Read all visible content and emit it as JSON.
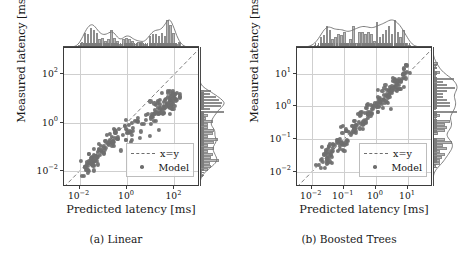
{
  "figure": {
    "width": 465,
    "height": 262,
    "background": "#ffffff",
    "point_color": "#6e6e6e",
    "hist_fill": "#b9b9b9",
    "hist_edge": "#8d8d8d",
    "axis_color": "#3b3b3b",
    "grid_color": "#cfcfcf"
  },
  "chart_data": [
    {
      "type": "scatter",
      "panel_id": "a",
      "caption": "(a) Linear",
      "title": "",
      "xlabel": "Predicted latency [ms]",
      "ylabel": "Measured latency [ms]",
      "xscale": "log",
      "yscale": "log",
      "xlim": [
        0.0022,
        1200
      ],
      "ylim": [
        0.0022,
        1200
      ],
      "grid": true,
      "legend_position": "lower right",
      "xticks": [
        0.01,
        1,
        100
      ],
      "xticklabels": [
        "10−2",
        "10⁰",
        "10²"
      ],
      "yticks": [
        0.01,
        1,
        100
      ],
      "yticklabels": [
        "10−2",
        "10⁰",
        "10²"
      ],
      "xtick_exponents": [
        "-2",
        "0",
        "2"
      ],
      "ytick_exponents": [
        "-2",
        "0",
        "2"
      ],
      "series": [
        {
          "name": "x=y",
          "type": "line",
          "style": "dashed",
          "color": "#6e6e6e",
          "points": [
            [
              0.0022,
              0.0022
            ],
            [
              1200,
              1200
            ]
          ]
        },
        {
          "name": "Model",
          "type": "scatter",
          "marker": "o",
          "color": "#6e6e6e",
          "n_points": 214,
          "x": [
            0.0041,
            0.0047,
            0.0052,
            0.0058,
            0.0061,
            0.0066,
            0.0072,
            0.0078,
            0.0085,
            0.0092,
            0.0098,
            0.0105,
            0.0112,
            0.0119,
            0.0128,
            0.0136,
            0.0145,
            0.0152,
            0.0163,
            0.0174,
            0.0186,
            0.0195,
            0.0208,
            0.0221,
            0.0235,
            0.0249,
            0.0262,
            0.0278,
            0.0295,
            0.0312,
            0.033,
            0.0349,
            0.0369,
            0.0391,
            0.0414,
            0.0438,
            0.0463,
            0.049,
            0.0519,
            0.0549,
            0.0581,
            0.0615,
            0.0651,
            0.0689,
            0.0729,
            0.0772,
            0.0817,
            0.0865,
            0.0915,
            0.0969,
            0.1026,
            0.1086,
            0.1149,
            0.1217,
            0.1288,
            0.1364,
            0.1443,
            0.1528,
            0.1617,
            0.1712,
            0.1812,
            0.1918,
            0.203,
            0.2149,
            0.2275,
            0.2408,
            0.2549,
            0.2698,
            0.2856,
            0.3023,
            0.32,
            0.3387,
            0.3585,
            0.3795,
            0.4017,
            0.4252,
            0.4501,
            0.4764,
            0.5043,
            0.5338,
            0.565,
            0.5981,
            0.6331,
            0.6701,
            0.7093,
            0.7508,
            0.7947,
            0.8412,
            0.8904,
            0.9425,
            0.9977,
            1.0561,
            1.1179,
            1.1833,
            1.2525,
            1.3258,
            1.4034,
            1.4855,
            1.5724,
            1.6644,
            1.7618,
            1.8649,
            1.974,
            2.0895,
            2.2118,
            2.3412,
            2.4782,
            2.6232,
            2.7767,
            2.9392,
            3.1112,
            3.2933,
            3.486,
            3.69,
            3.9059,
            4.1345,
            4.3764,
            4.6325,
            4.9036,
            5.1905,
            5.4942,
            5.8157,
            6.156,
            6.5162,
            6.8975,
            7.3012,
            7.7284,
            8.1807,
            8.6594,
            9.1662,
            9.7026,
            10.27,
            10.871,
            11.507,
            12.18,
            12.893,
            13.647,
            14.446,
            15.291,
            16.186,
            17.133,
            18.135,
            19.196,
            20.32,
            21.509,
            22.767,
            24.099,
            25.509,
            27.002,
            28.582,
            30.255,
            32.025,
            33.899,
            35.883,
            37.983,
            40.205,
            42.558,
            45.048,
            47.684,
            50.474,
            53.428,
            56.554,
            59.863,
            63.366,
            67.074,
            70.998,
            75.153,
            79.55,
            84.205,
            89.132,
            94.347,
            99.867,
            105.71,
            111.9,
            118.45,
            125.38,
            132.71,
            140.48,
            148.7,
            157.4,
            166.61,
            176.36,
            186.68,
            197.6,
            209.16,
            221.4,
            234.35,
            248.06,
            262.58,
            277.94,
            294.2,
            311.42,
            329.64,
            348.93,
            369.35,
            390.96,
            413.84,
            438.05,
            463.68,
            490.81,
            519.53,
            549.93,
            582.1,
            616.16,
            652.21,
            690.37,
            730.76,
            773.52,
            818.77,
            866.68,
            917.39,
            971.06,
            1027.9,
            1088.1
          ],
          "comment_x": "log-uniform spread of predicted latencies from ~0.004 ms to ~1100 ms",
          "y_relation": "y = x * f where f decreases from ~1 at low x to ~0.08 at high x (linear model saturates); scatter sigma ~0.22 dex",
          "trend_points": [
            [
              0.004,
              0.0035
            ],
            [
              0.01,
              0.009
            ],
            [
              0.1,
              0.085
            ],
            [
              1.0,
              0.75
            ],
            [
              10,
              4.5
            ],
            [
              100,
              18
            ],
            [
              1000,
              45
            ]
          ]
        }
      ]
    },
    {
      "type": "scatter",
      "panel_id": "b",
      "caption": "(b) Boosted Trees",
      "title": "",
      "xlabel": "Predicted latency [ms]",
      "ylabel": "Measured latency [ms]",
      "xscale": "log",
      "yscale": "log",
      "xlim": [
        0.0035,
        60
      ],
      "ylim": [
        0.0035,
        60
      ],
      "grid": true,
      "legend_position": "lower right",
      "xticks": [
        0.01,
        0.1,
        1,
        10
      ],
      "xticklabels": [
        "10−2",
        "10−1",
        "10⁰",
        "10¹"
      ],
      "yticks": [
        0.01,
        0.1,
        1,
        10
      ],
      "yticklabels": [
        "10−2",
        "10−1",
        "10⁰",
        "10¹"
      ],
      "xtick_exponents": [
        "-2",
        "-1",
        "0",
        "1"
      ],
      "ytick_exponents": [
        "-2",
        "-1",
        "0",
        "1"
      ],
      "series": [
        {
          "name": "x=y",
          "type": "line",
          "style": "dashed",
          "color": "#6e6e6e",
          "points": [
            [
              0.0035,
              0.0035
            ],
            [
              60,
              60
            ]
          ]
        },
        {
          "name": "Model",
          "type": "scatter",
          "marker": "o",
          "color": "#6e6e6e",
          "n_points": 214,
          "y_relation": "y ≈ x with small multiplicative scatter sigma ~0.16 dex; tight agreement along identity across 4 decades",
          "trend_points": [
            [
              0.006,
              0.006
            ],
            [
              0.01,
              0.0105
            ],
            [
              0.1,
              0.1
            ],
            [
              1.0,
              1.0
            ],
            [
              10,
              10.5
            ],
            [
              40,
              42
            ]
          ]
        }
      ]
    }
  ],
  "panels": [
    {
      "id": "a",
      "caption": "(a) Linear",
      "axis": {
        "xlabel": "Predicted latency [ms]",
        "ylabel": "Measured latency [ms]",
        "xticklabels": [
          {
            "mantissa": "10",
            "exp": "-2"
          },
          {
            "mantissa": "10",
            "exp": "0"
          },
          {
            "mantissa": "10",
            "exp": "2"
          }
        ],
        "yticklabels": [
          {
            "mantissa": "10",
            "exp": "2"
          },
          {
            "mantissa": "10",
            "exp": "0"
          },
          {
            "mantissa": "10",
            "exp": "-2"
          }
        ]
      },
      "legend": {
        "entries": [
          {
            "label": "x=y",
            "key": "dashed-line"
          },
          {
            "label": "Model",
            "key": "dot-marker"
          }
        ]
      },
      "marginals": {
        "top": {
          "name": "top-histogram",
          "kde": true
        },
        "right": {
          "name": "right-histogram",
          "kde": true
        }
      }
    },
    {
      "id": "b",
      "caption": "(b) Boosted Trees",
      "axis": {
        "xlabel": "Predicted latency [ms]",
        "ylabel": "Measured latency [ms]",
        "xticklabels": [
          {
            "mantissa": "10",
            "exp": "-2"
          },
          {
            "mantissa": "10",
            "exp": "-1"
          },
          {
            "mantissa": "10",
            "exp": "0"
          },
          {
            "mantissa": "10",
            "exp": "1"
          }
        ],
        "yticklabels": [
          {
            "mantissa": "10",
            "exp": "1"
          },
          {
            "mantissa": "10",
            "exp": "0"
          },
          {
            "mantissa": "10",
            "exp": "-1"
          },
          {
            "mantissa": "10",
            "exp": "-2"
          }
        ]
      },
      "legend": {
        "entries": [
          {
            "label": "x=y",
            "key": "dashed-line"
          },
          {
            "label": "Model",
            "key": "dot-marker"
          }
        ]
      },
      "marginals": {
        "top": {
          "name": "top-histogram",
          "kde": true
        },
        "right": {
          "name": "right-histogram",
          "kde": true
        }
      }
    }
  ]
}
